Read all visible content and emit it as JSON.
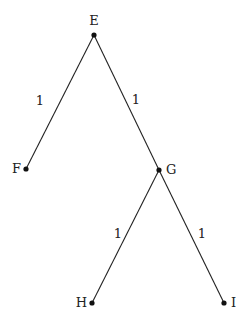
{
  "diagram": {
    "type": "tree",
    "nodes": [
      {
        "id": "E",
        "label": "E",
        "x": 94,
        "y": 35,
        "label_x": 94,
        "label_y": 25,
        "anchor": "middle"
      },
      {
        "id": "F",
        "label": "F",
        "x": 26,
        "y": 169,
        "label_x": 21,
        "label_y": 173,
        "anchor": "end"
      },
      {
        "id": "G",
        "label": "G",
        "x": 159,
        "y": 170,
        "label_x": 166,
        "label_y": 174,
        "anchor": "start"
      },
      {
        "id": "H",
        "label": "H",
        "x": 92,
        "y": 303,
        "label_x": 87,
        "label_y": 307,
        "anchor": "end"
      },
      {
        "id": "I",
        "label": "I",
        "x": 224,
        "y": 303,
        "label_x": 231,
        "label_y": 307,
        "anchor": "start"
      }
    ],
    "edges": [
      {
        "from": "E",
        "to": "F",
        "weight": "1",
        "label_x": 40,
        "label_y": 105
      },
      {
        "from": "E",
        "to": "G",
        "weight": "1",
        "label_x": 136,
        "label_y": 104
      },
      {
        "from": "G",
        "to": "H",
        "weight": "1",
        "label_x": 118,
        "label_y": 238
      },
      {
        "from": "G",
        "to": "I",
        "weight": "1",
        "label_x": 202,
        "label_y": 238
      }
    ]
  }
}
